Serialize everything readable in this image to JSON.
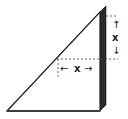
{
  "diagram": {
    "type": "geometry",
    "labels": {
      "vertical": "x",
      "horizontal": "x"
    },
    "arrows": {
      "up": "↑",
      "down": "↓",
      "left": "←",
      "right": "→"
    },
    "colors": {
      "stroke": "#222222",
      "shade": "#2a2a2a",
      "fill": "#ffffff"
    }
  }
}
